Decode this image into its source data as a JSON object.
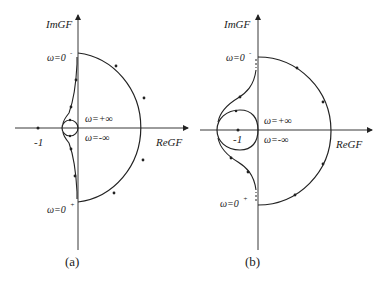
{
  "figure": {
    "panels": [
      {
        "id": "a",
        "caption": "(a)",
        "x_axis_label": "ReGF",
        "y_axis_label": "ImGF",
        "critical_point_label": "-1",
        "omega_zero_minus": "ω=0",
        "omega_zero_minus_sup": "-",
        "omega_zero_plus": "ω=0",
        "omega_zero_plus_sup": "+",
        "omega_pos_inf": "ω=+∞",
        "omega_neg_inf": "ω=-∞"
      },
      {
        "id": "b",
        "caption": "(b)",
        "x_axis_label": "ReGF",
        "y_axis_label": "ImGF",
        "critical_point_label": "-1",
        "omega_zero_minus": "ω=0",
        "omega_zero_minus_sup": "-",
        "omega_zero_plus": "ω=0",
        "omega_zero_plus_sup": "+",
        "omega_pos_inf": "ω=+∞",
        "omega_neg_inf": "ω=-∞"
      }
    ],
    "colors": {
      "stroke": "#222222",
      "background": "#ffffff"
    }
  }
}
